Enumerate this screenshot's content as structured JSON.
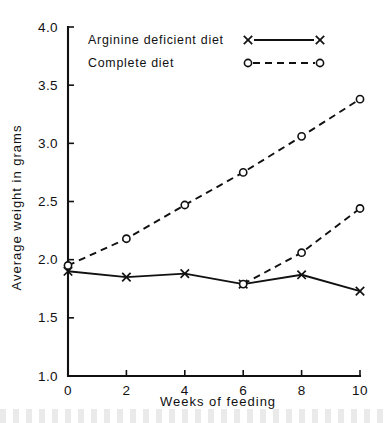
{
  "chart_data": {
    "type": "line",
    "title": "",
    "xlabel": "Weeks of feeding",
    "ylabel": "Average weight in grams",
    "x": [
      0,
      2,
      4,
      6,
      8,
      10
    ],
    "xlim": [
      0,
      10
    ],
    "ylim": [
      1.0,
      4.0
    ],
    "xticks": [
      "0",
      "2",
      "4",
      "6",
      "8",
      "10"
    ],
    "yticks": [
      "1.0",
      "1.5",
      "2.0",
      "2.5",
      "3.0",
      "3.5",
      "4.0"
    ],
    "grid": false,
    "legend_position": "top-left-inside",
    "series": [
      {
        "name": "Arginine deficient diet",
        "marker": "x",
        "linestyle": "solid",
        "x": [
          0,
          2,
          4,
          6,
          8,
          10
        ],
        "values": [
          1.9,
          1.85,
          1.88,
          1.79,
          1.87,
          1.73
        ]
      },
      {
        "name": "Complete diet",
        "marker": "o",
        "linestyle": "dashed",
        "x": [
          0,
          2,
          4,
          6,
          8,
          10
        ],
        "values": [
          1.95,
          2.18,
          2.47,
          2.75,
          3.06,
          3.38
        ]
      },
      {
        "name": "Complete diet (repletion from week 6)",
        "marker": "o",
        "linestyle": "dashed",
        "x": [
          6,
          8,
          10
        ],
        "values": [
          1.79,
          2.06,
          2.44
        ]
      }
    ]
  },
  "legend": {
    "entries": [
      {
        "label": "Arginine deficient diet",
        "marker": "x",
        "linestyle": "solid"
      },
      {
        "label": "Complete diet",
        "marker": "o",
        "linestyle": "dashed"
      }
    ]
  },
  "axes": {
    "x_title": "Weeks of feeding",
    "y_title": "Average weight in grams",
    "x_tick_labels": [
      "0",
      "2",
      "4",
      "6",
      "8",
      "10"
    ],
    "y_tick_labels": [
      "1.0",
      "1.5",
      "2.0",
      "2.5",
      "3.0",
      "3.5",
      "4.0"
    ]
  },
  "colors": {
    "ink": "#111111",
    "background": "#ffffff"
  }
}
